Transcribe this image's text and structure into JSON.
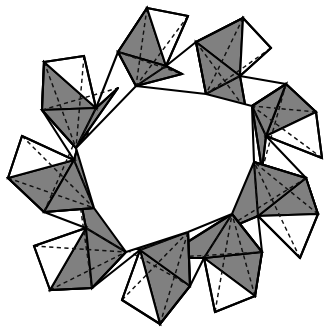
{
  "figure": {
    "caption": "",
    "background_color": "#ffffff",
    "outline_color": "#000000",
    "shaded_face_color": "#808080",
    "light_face_color": "#ffffff",
    "hidden_edge_style": "dashed",
    "watermark_text": ""
  },
  "geometry": {
    "unit_count": 9,
    "unit_name": "tetrahedron",
    "center": {
      "x": 168,
      "y": 166
    },
    "outer_radius": 166,
    "inner_radius": 84,
    "inner_hole_sides": 9,
    "twist_degrees": 17,
    "units": [
      {
        "index": 0,
        "angle_deg": -90,
        "outer_apex": {
          "x": 147,
          "y": 8
        },
        "outer_right": {
          "x": 188,
          "y": 16
        },
        "hinge_a": {
          "x": 166,
          "y": 66
        },
        "hinge_b": {
          "x": 118,
          "y": 52
        },
        "inner_a": {
          "x": 136,
          "y": 86
        },
        "inner_b": {
          "x": 182,
          "y": 74
        },
        "white_face": [
          {
            "x": 147,
            "y": 8
          },
          {
            "x": 188,
            "y": 16
          },
          {
            "x": 166,
            "y": 66
          }
        ],
        "gray_face_1": [
          {
            "x": 147,
            "y": 8
          },
          {
            "x": 166,
            "y": 66
          },
          {
            "x": 118,
            "y": 52
          }
        ],
        "gray_face_2": [
          {
            "x": 118,
            "y": 52
          },
          {
            "x": 166,
            "y": 66
          },
          {
            "x": 136,
            "y": 86
          }
        ]
      },
      {
        "index": 1,
        "angle_deg": -50,
        "outer_apex": {
          "x": 243,
          "y": 18
        },
        "outer_right": {
          "x": 271,
          "y": 48
        },
        "hinge_a": {
          "x": 240,
          "y": 76
        },
        "hinge_b": {
          "x": 196,
          "y": 42
        },
        "inner_a": {
          "x": 206,
          "y": 94
        },
        "inner_b": {
          "x": 246,
          "y": 110
        },
        "white_face": [
          {
            "x": 243,
            "y": 18
          },
          {
            "x": 271,
            "y": 48
          },
          {
            "x": 240,
            "y": 76
          }
        ],
        "gray_face_1": [
          {
            "x": 196,
            "y": 42
          },
          {
            "x": 243,
            "y": 18
          },
          {
            "x": 240,
            "y": 76
          }
        ],
        "gray_face_2": [
          {
            "x": 196,
            "y": 42
          },
          {
            "x": 240,
            "y": 76
          },
          {
            "x": 206,
            "y": 94
          }
        ]
      },
      {
        "index": 2,
        "angle_deg": -10,
        "outer_apex": {
          "x": 316,
          "y": 112
        },
        "outer_right": {
          "x": 322,
          "y": 158
        },
        "hinge_a": {
          "x": 266,
          "y": 136
        },
        "hinge_b": {
          "x": 286,
          "y": 84
        },
        "inner_a": {
          "x": 252,
          "y": 106
        },
        "inner_b": {
          "x": 262,
          "y": 170
        },
        "white_face": [
          {
            "x": 316,
            "y": 112
          },
          {
            "x": 322,
            "y": 158
          },
          {
            "x": 266,
            "y": 136
          }
        ],
        "gray_face_1": [
          {
            "x": 286,
            "y": 84
          },
          {
            "x": 316,
            "y": 112
          },
          {
            "x": 266,
            "y": 136
          }
        ],
        "gray_face_2": [
          {
            "x": 286,
            "y": 84
          },
          {
            "x": 266,
            "y": 136
          },
          {
            "x": 252,
            "y": 106
          }
        ]
      },
      {
        "index": 3,
        "angle_deg": 30,
        "outer_apex": {
          "x": 318,
          "y": 214
        },
        "outer_right": {
          "x": 300,
          "y": 258
        },
        "hinge_a": {
          "x": 258,
          "y": 216
        },
        "hinge_b": {
          "x": 306,
          "y": 178
        },
        "inner_a": {
          "x": 254,
          "y": 162
        },
        "inner_b": {
          "x": 220,
          "y": 232
        },
        "white_face": [
          {
            "x": 318,
            "y": 214
          },
          {
            "x": 300,
            "y": 258
          },
          {
            "x": 258,
            "y": 216
          }
        ],
        "gray_face_1": [
          {
            "x": 306,
            "y": 178
          },
          {
            "x": 318,
            "y": 214
          },
          {
            "x": 258,
            "y": 216
          }
        ],
        "gray_face_2": [
          {
            "x": 306,
            "y": 178
          },
          {
            "x": 258,
            "y": 216
          },
          {
            "x": 254,
            "y": 162
          }
        ]
      },
      {
        "index": 4,
        "angle_deg": 70,
        "outer_apex": {
          "x": 255,
          "y": 296
        },
        "outer_right": {
          "x": 215,
          "y": 312
        },
        "hinge_a": {
          "x": 204,
          "y": 258
        },
        "hinge_b": {
          "x": 262,
          "y": 252
        },
        "inner_a": {
          "x": 232,
          "y": 214
        },
        "inner_b": {
          "x": 162,
          "y": 258
        },
        "white_face": [
          {
            "x": 255,
            "y": 296
          },
          {
            "x": 215,
            "y": 312
          },
          {
            "x": 204,
            "y": 258
          }
        ],
        "gray_face_1": [
          {
            "x": 262,
            "y": 252
          },
          {
            "x": 255,
            "y": 296
          },
          {
            "x": 204,
            "y": 258
          }
        ],
        "gray_face_2": [
          {
            "x": 262,
            "y": 252
          },
          {
            "x": 204,
            "y": 258
          },
          {
            "x": 232,
            "y": 214
          }
        ]
      },
      {
        "index": 5,
        "angle_deg": 110,
        "outer_apex": {
          "x": 160,
          "y": 324
        },
        "outer_right": {
          "x": 122,
          "y": 300
        },
        "hinge_a": {
          "x": 140,
          "y": 250
        },
        "hinge_b": {
          "x": 190,
          "y": 286
        },
        "inner_a": {
          "x": 188,
          "y": 232
        },
        "inner_b": {
          "x": 102,
          "y": 236
        },
        "white_face": [
          {
            "x": 160,
            "y": 324
          },
          {
            "x": 122,
            "y": 300
          },
          {
            "x": 140,
            "y": 250
          }
        ],
        "gray_face_1": [
          {
            "x": 190,
            "y": 286
          },
          {
            "x": 160,
            "y": 324
          },
          {
            "x": 140,
            "y": 250
          }
        ],
        "gray_face_2": [
          {
            "x": 190,
            "y": 286
          },
          {
            "x": 140,
            "y": 250
          },
          {
            "x": 188,
            "y": 232
          }
        ]
      },
      {
        "index": 6,
        "angle_deg": 150,
        "outer_apex": {
          "x": 50,
          "y": 290
        },
        "outer_right": {
          "x": 34,
          "y": 246
        },
        "hinge_a": {
          "x": 86,
          "y": 228
        },
        "hinge_b": {
          "x": 92,
          "y": 288
        },
        "inner_a": {
          "x": 126,
          "y": 252
        },
        "inner_b": {
          "x": 76,
          "y": 176
        },
        "white_face": [
          {
            "x": 50,
            "y": 290
          },
          {
            "x": 34,
            "y": 246
          },
          {
            "x": 86,
            "y": 228
          }
        ],
        "gray_face_1": [
          {
            "x": 92,
            "y": 288
          },
          {
            "x": 50,
            "y": 290
          },
          {
            "x": 86,
            "y": 228
          }
        ],
        "gray_face_2": [
          {
            "x": 92,
            "y": 288
          },
          {
            "x": 86,
            "y": 228
          },
          {
            "x": 126,
            "y": 252
          }
        ]
      },
      {
        "index": 7,
        "angle_deg": 190,
        "outer_apex": {
          "x": 8,
          "y": 178
        },
        "outer_right": {
          "x": 22,
          "y": 136
        },
        "hinge_a": {
          "x": 74,
          "y": 160
        },
        "hinge_b": {
          "x": 44,
          "y": 212
        },
        "inner_a": {
          "x": 94,
          "y": 208
        },
        "inner_b": {
          "x": 86,
          "y": 116
        },
        "white_face": [
          {
            "x": 8,
            "y": 178
          },
          {
            "x": 22,
            "y": 136
          },
          {
            "x": 74,
            "y": 160
          }
        ],
        "gray_face_1": [
          {
            "x": 44,
            "y": 212
          },
          {
            "x": 8,
            "y": 178
          },
          {
            "x": 74,
            "y": 160
          }
        ],
        "gray_face_2": [
          {
            "x": 44,
            "y": 212
          },
          {
            "x": 74,
            "y": 160
          },
          {
            "x": 94,
            "y": 208
          }
        ]
      },
      {
        "index": 8,
        "angle_deg": 230,
        "outer_apex": {
          "x": 44,
          "y": 62
        },
        "outer_right": {
          "x": 84,
          "y": 56
        },
        "hinge_a": {
          "x": 96,
          "y": 108
        },
        "hinge_b": {
          "x": 42,
          "y": 110
        },
        "inner_a": {
          "x": 76,
          "y": 148
        },
        "inner_b": {
          "x": 118,
          "y": 88
        },
        "white_face": [
          {
            "x": 44,
            "y": 62
          },
          {
            "x": 84,
            "y": 56
          },
          {
            "x": 96,
            "y": 108
          }
        ],
        "gray_face_1": [
          {
            "x": 42,
            "y": 110
          },
          {
            "x": 44,
            "y": 62
          },
          {
            "x": 96,
            "y": 108
          }
        ],
        "gray_face_2": [
          {
            "x": 42,
            "y": 110
          },
          {
            "x": 96,
            "y": 108
          },
          {
            "x": 76,
            "y": 148
          }
        ]
      }
    ]
  }
}
